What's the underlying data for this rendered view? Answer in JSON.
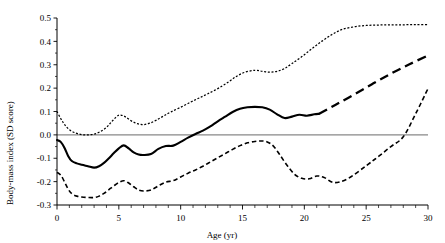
{
  "chart_data": {
    "type": "line",
    "title": "",
    "xlabel": "Age (yr)",
    "ylabel": "Body-mass index (SD score)",
    "xlim": [
      0,
      30
    ],
    "ylim": [
      -0.3,
      0.5
    ],
    "xticks": [
      0,
      1,
      2,
      3,
      4,
      5,
      6,
      7,
      8,
      9,
      10,
      11,
      12,
      13,
      14,
      15,
      16,
      17,
      18,
      19,
      20,
      21,
      22,
      23,
      24,
      25,
      26,
      27,
      28,
      29,
      30
    ],
    "xtick_labels": [
      "0",
      "5",
      "10",
      "15",
      "20",
      "25",
      "30"
    ],
    "xtick_label_values": [
      0,
      5,
      10,
      15,
      20,
      25,
      30
    ],
    "yticks": [
      -0.3,
      -0.2,
      -0.1,
      0.0,
      0.1,
      0.2,
      0.3,
      0.4,
      0.5
    ],
    "ytick_labels": [
      "0.5",
      "0.4",
      "0.3",
      "0.2",
      "0.1",
      "0.0",
      "-0.1",
      "-0.2",
      "-0.3"
    ],
    "grid": false,
    "legend": "none",
    "reference_line": {
      "y": 0.0,
      "color": "#888888",
      "style": "solid"
    },
    "series": [
      {
        "name": "upper-confidence-limit",
        "style": "dotted",
        "x": [
          0,
          0.3,
          0.6,
          1.0,
          1.5,
          2.0,
          2.5,
          3.0,
          3.5,
          4.0,
          4.4,
          4.8,
          5.1,
          5.5,
          6.0,
          6.5,
          7.0,
          7.5,
          8.0,
          8.6,
          9.2,
          10.0,
          10.8,
          11.5,
          12.2,
          13.0,
          13.8,
          14.5,
          15.2,
          16.0,
          16.6,
          17.2,
          17.8,
          18.4,
          19.0,
          19.8,
          20.6,
          21.4,
          22.2,
          23.0,
          24.0,
          25.0,
          26.0,
          27.0,
          28.0,
          29.0,
          30.0
        ],
        "y": [
          0.1,
          0.07,
          0.045,
          0.022,
          0.008,
          0.001,
          0.0,
          0.003,
          0.014,
          0.032,
          0.055,
          0.077,
          0.085,
          0.078,
          0.06,
          0.048,
          0.044,
          0.05,
          0.062,
          0.08,
          0.098,
          0.118,
          0.14,
          0.158,
          0.176,
          0.198,
          0.224,
          0.25,
          0.268,
          0.276,
          0.272,
          0.268,
          0.272,
          0.284,
          0.305,
          0.335,
          0.368,
          0.4,
          0.428,
          0.45,
          0.462,
          0.468,
          0.47,
          0.471,
          0.471,
          0.472,
          0.472
        ]
      },
      {
        "name": "point-estimate",
        "style": "solid",
        "observed_until": 21.2,
        "x": [
          0,
          0.3,
          0.6,
          0.9,
          1.2,
          1.6,
          2.0,
          2.5,
          3.0,
          3.4,
          3.8,
          4.2,
          4.6,
          5.0,
          5.4,
          5.8,
          6.2,
          6.6,
          7.0,
          7.6,
          8.2,
          8.8,
          9.4,
          10.0,
          10.6,
          11.2,
          11.8,
          12.4,
          13.0,
          13.6,
          14.2,
          14.8,
          15.4,
          16.0,
          16.6,
          17.2,
          17.8,
          18.4,
          19.0,
          19.6,
          20.2,
          20.8,
          21.2
        ],
        "y": [
          -0.022,
          -0.03,
          -0.055,
          -0.09,
          -0.112,
          -0.122,
          -0.128,
          -0.134,
          -0.14,
          -0.134,
          -0.12,
          -0.1,
          -0.078,
          -0.058,
          -0.045,
          -0.058,
          -0.075,
          -0.084,
          -0.086,
          -0.082,
          -0.06,
          -0.048,
          -0.046,
          -0.03,
          -0.012,
          0.004,
          0.018,
          0.036,
          0.058,
          0.078,
          0.098,
          0.112,
          0.118,
          0.12,
          0.118,
          0.108,
          0.088,
          0.072,
          0.078,
          0.086,
          0.082,
          0.088,
          0.09
        ]
      },
      {
        "name": "point-estimate-extrapolated",
        "style": "dashed-heavy",
        "x": [
          21.2,
          22.5,
          24.0,
          25.5,
          27.0,
          28.5,
          30.0
        ],
        "y": [
          0.09,
          0.128,
          0.172,
          0.218,
          0.262,
          0.302,
          0.34
        ]
      },
      {
        "name": "lower-confidence-limit",
        "style": "dashed",
        "x": [
          0,
          0.3,
          0.6,
          0.9,
          1.2,
          1.6,
          2.0,
          2.5,
          3.0,
          3.4,
          3.8,
          4.2,
          4.6,
          5.0,
          5.4,
          5.8,
          6.2,
          6.6,
          7.0,
          7.6,
          8.2,
          8.8,
          9.4,
          10.0,
          10.6,
          11.2,
          11.8,
          12.4,
          13.0,
          13.6,
          14.2,
          14.8,
          15.4,
          16.0,
          16.5,
          17.0,
          17.5,
          18.0,
          18.6,
          19.2,
          19.8,
          20.4,
          21.0,
          21.6,
          22.4,
          23.5,
          25.0,
          26.0,
          27.0,
          28.0,
          29.0,
          30.0
        ],
        "y": [
          -0.16,
          -0.172,
          -0.2,
          -0.232,
          -0.252,
          -0.262,
          -0.266,
          -0.268,
          -0.268,
          -0.262,
          -0.25,
          -0.234,
          -0.218,
          -0.204,
          -0.196,
          -0.206,
          -0.222,
          -0.236,
          -0.24,
          -0.236,
          -0.218,
          -0.202,
          -0.196,
          -0.18,
          -0.164,
          -0.15,
          -0.134,
          -0.116,
          -0.098,
          -0.08,
          -0.062,
          -0.046,
          -0.034,
          -0.028,
          -0.026,
          -0.03,
          -0.048,
          -0.084,
          -0.13,
          -0.168,
          -0.186,
          -0.188,
          -0.176,
          -0.182,
          -0.204,
          -0.188,
          -0.132,
          -0.092,
          -0.05,
          -0.008,
          0.09,
          0.198
        ]
      }
    ]
  },
  "axes": {
    "y_title": "Body-mass index (SD score)",
    "x_title": "Age (yr)"
  }
}
